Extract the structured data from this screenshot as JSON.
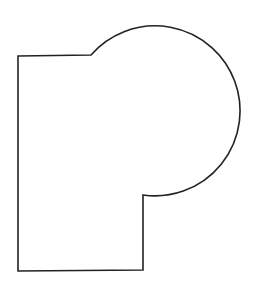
{
  "canvas": {
    "width": 258,
    "height": 281,
    "background": "#ffffff"
  },
  "shape": {
    "name": "rectangle-with-circular-lobe",
    "stroke": "#222222",
    "stroke_width": 1.6,
    "fill": "none",
    "path": "M 18 56 L 91 55 A 85 85 0 1 1 143 195 L 143 270 L 18 271 Z"
  }
}
